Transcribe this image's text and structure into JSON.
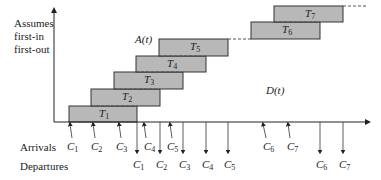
{
  "axis_note": [
    "Assumes",
    "first-in",
    "first-out"
  ],
  "curve_labels": {
    "arrivals_curve": "A(t)",
    "departures_curve": "D(t)"
  },
  "row_labels": {
    "arrivals": "Arrivals",
    "departures": "Departures"
  },
  "bars": [
    {
      "name": "T",
      "sub": "1"
    },
    {
      "name": "T",
      "sub": "2"
    },
    {
      "name": "T",
      "sub": "3"
    },
    {
      "name": "T",
      "sub": "4"
    },
    {
      "name": "T",
      "sub": "5"
    },
    {
      "name": "T",
      "sub": "6"
    },
    {
      "name": "T",
      "sub": "7"
    }
  ],
  "arrivals": [
    {
      "name": "C",
      "sub": "1"
    },
    {
      "name": "C",
      "sub": "2"
    },
    {
      "name": "C",
      "sub": "3"
    },
    {
      "name": "C",
      "sub": "4"
    },
    {
      "name": "C",
      "sub": "5"
    },
    {
      "name": "C",
      "sub": "6"
    },
    {
      "name": "C",
      "sub": "7"
    }
  ],
  "departures": [
    {
      "name": "C",
      "sub": "1"
    },
    {
      "name": "C",
      "sub": "2"
    },
    {
      "name": "C",
      "sub": "3"
    },
    {
      "name": "C",
      "sub": "4"
    },
    {
      "name": "C",
      "sub": "5"
    },
    {
      "name": "C",
      "sub": "6"
    },
    {
      "name": "C",
      "sub": "7"
    }
  ],
  "colors": {
    "bar_fill": "#b8b8b8",
    "line": "#333333"
  }
}
